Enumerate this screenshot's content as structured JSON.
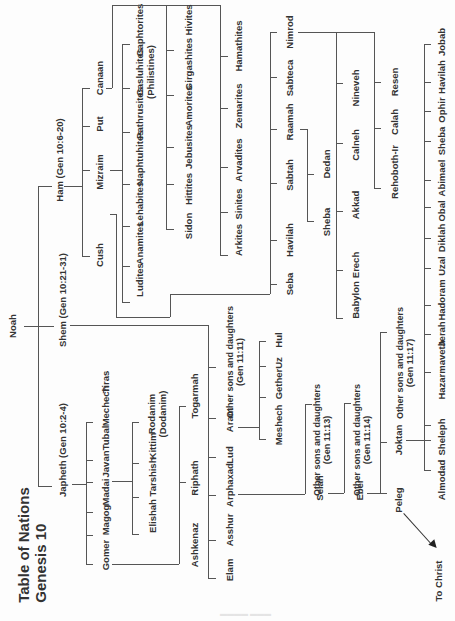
{
  "title": {
    "line1": "Table of Nations",
    "line2": "Genesis 10"
  },
  "root": {
    "name": "Noah"
  },
  "sons": {
    "ham": "Ham (Gen 10:6-20)",
    "shem": "Shem (Gen 10:21-31)",
    "japheth": "Japheth (Gen 10:2-4)"
  },
  "ham_sons": [
    "Cush",
    "Mizraim",
    "Put",
    "Canaan"
  ],
  "cush_sons": [
    "Seba",
    "Havilah",
    "Sabtah",
    "Raamah",
    "Sabteca",
    "Nimrod"
  ],
  "raamah_sons": [
    "Sheba",
    "Dedan"
  ],
  "nimrod_cities": {
    "group1": [
      "Babylon",
      "Erech",
      "Akkad",
      "Calneh",
      "Nineveh"
    ],
    "group2": [
      "Rehoboth-Ir",
      "Calah",
      "Resen"
    ]
  },
  "mizraim_sons": [
    "Ludites",
    "Anamites",
    "Lehabites",
    "Naphtuhites",
    "Pathrusites",
    "Casluhites",
    "Caphtorites"
  ],
  "philistines_note": "(Philistines)",
  "canaan_sons": {
    "row1": [
      "Sidon",
      "Hittites",
      "Jebusites",
      "Amorites",
      "Girgashites",
      "Hivites"
    ],
    "row2": [
      "Arkites",
      "Sinites",
      "Arvadites",
      "Zemarites",
      "Hamathites"
    ]
  },
  "shem_sons": [
    "Elam",
    "Asshur",
    "Arphaxad",
    "Lud",
    "Aram"
  ],
  "shem_other": {
    "line1": "Other sons and daughters",
    "line2": "(Gen 11:11)"
  },
  "aram_sons": [
    "Meshech",
    "Gether",
    "Uz",
    "Hul"
  ],
  "arphaxad_line": {
    "selah": "Selah",
    "selah_other": {
      "line1": "Other sons and daughters",
      "line2": "(Gen 11:13)"
    },
    "eber": "Eber",
    "eber_other": {
      "line1": "Other sons and daughters",
      "line2": "(Gen 11:14)"
    },
    "peleg": "Peleg",
    "joktan": "Joktan",
    "joktan_other": {
      "line1": "Other sons and daughters",
      "line2": "(Gen 11:17)"
    },
    "to_christ": "To Christ"
  },
  "joktan_sons": [
    "Almodad",
    "Sheleph",
    "Hazarmaveth",
    "Jerah",
    "Hadoram",
    "Uzal",
    "Diklah",
    "Obal",
    "Abimael",
    "Sheba",
    "Ophir",
    "Havilah",
    "Jobab"
  ],
  "japheth_sons": [
    "Gomer",
    "Magog",
    "Madai",
    "Javan",
    "Tubal",
    "Mechech",
    "Tiras"
  ],
  "gomer_sons": [
    "Ashkenaz",
    "Riphath",
    "Togarmah"
  ],
  "javan_sons": [
    "Elishah",
    "Tarshish",
    "Kittim",
    "Rodanim"
  ],
  "dodanim_note": "(Dodanim)",
  "colors": {
    "line": "#555555",
    "text": "#333333",
    "background": "#fdfdfd"
  }
}
